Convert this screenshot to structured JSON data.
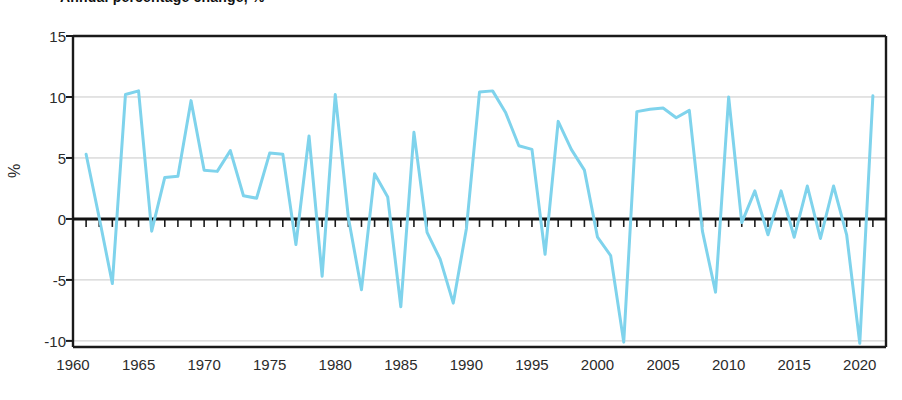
{
  "chart_data": {
    "type": "line",
    "title": "Annual percentage change, %",
    "xlabel": "",
    "ylabel": "%",
    "xlim": [
      1960,
      2022
    ],
    "ylim": [
      -10.5,
      15
    ],
    "yticks": [
      15,
      10,
      5,
      0,
      -5,
      -10
    ],
    "ytick_labels": [
      "15",
      "10",
      "5",
      "0",
      "-5",
      "-10"
    ],
    "xticks": [
      1960,
      1965,
      1970,
      1975,
      1980,
      1985,
      1990,
      1995,
      2000,
      2005,
      2010,
      2015,
      2020
    ],
    "xtick_labels": [
      "1960",
      "1965",
      "1970",
      "1975",
      "1980",
      "1985",
      "1990",
      "1995",
      "2000",
      "2005",
      "2010",
      "2015",
      "2020"
    ],
    "grid": "horizontal",
    "legend": "none",
    "zero_line": true,
    "minor_xticks": true,
    "series": [
      {
        "name": "Annual percentage change",
        "color": "#7FD3EC",
        "line_width": 3,
        "x": [
          1961,
          1962,
          1963,
          1964,
          1965,
          1966,
          1967,
          1968,
          1969,
          1970,
          1971,
          1972,
          1973,
          1974,
          1975,
          1976,
          1977,
          1978,
          1979,
          1980,
          1981,
          1982,
          1983,
          1984,
          1985,
          1986,
          1987,
          1988,
          1989,
          1990,
          1991,
          1992,
          1993,
          1994,
          1995,
          1996,
          1997,
          1998,
          1999,
          2000,
          2001,
          2002,
          2003,
          2004,
          2005,
          2006,
          2007,
          2008,
          2009,
          2010,
          2011,
          2012,
          2013,
          2014,
          2015,
          2016,
          2017,
          2018,
          2019,
          2020,
          2021
        ],
        "values": [
          5.3,
          0.1,
          -5.3,
          10.2,
          10.5,
          -1.0,
          3.4,
          3.5,
          9.7,
          4.0,
          3.9,
          5.6,
          1.9,
          1.7,
          5.4,
          5.3,
          -2.1,
          6.8,
          -4.7,
          10.2,
          0.1,
          -5.8,
          3.7,
          1.8,
          -7.2,
          7.1,
          -1.1,
          -3.3,
          -6.9,
          -0.8,
          10.4,
          10.5,
          8.7,
          6.0,
          5.7,
          -2.9,
          8.0,
          5.7,
          4.0,
          -1.5,
          -3.0,
          -10.1,
          8.8,
          9.0,
          9.1,
          8.3,
          8.9,
          -1.0,
          -6.0,
          10.0,
          -0.3,
          2.3,
          -1.3,
          2.3,
          -1.5,
          2.7,
          -1.6,
          2.7,
          -1.3,
          -10.2,
          10.1
        ]
      }
    ]
  },
  "axes": {
    "y_title": "%"
  }
}
